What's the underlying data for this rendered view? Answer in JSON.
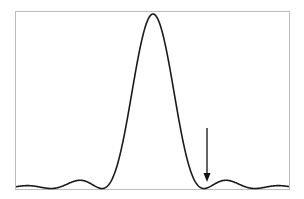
{
  "chart_data": {
    "type": "line",
    "title": "",
    "xlabel": "",
    "ylabel": "",
    "function": "I(x) = (sin(pi x)/(pi x))^2",
    "xlim": [
      -2.7,
      2.65
    ],
    "ylim": [
      0,
      1.0
    ],
    "grid": false,
    "legend": null,
    "series": [
      {
        "name": "intensity",
        "x": [
          -2.5,
          -2.0,
          -1.5,
          -1.0,
          -0.5,
          0.0,
          0.5,
          1.0,
          1.5,
          2.0,
          2.5
        ],
        "values": [
          0.016,
          0.0,
          0.045,
          0.0,
          0.405,
          1.0,
          0.405,
          0.0,
          0.045,
          0.0,
          0.016
        ]
      }
    ],
    "annotations": [
      {
        "type": "arrow",
        "target_x": 1.0,
        "label": "",
        "meaning": "first minimum"
      }
    ]
  },
  "colors": {
    "frame": "#bdbdbd",
    "curve": "#1a1a1a",
    "arrow": "#111111",
    "background": "#ffffff"
  },
  "layout": {
    "frame": {
      "left": 15,
      "top": 11,
      "right": 289,
      "bottom": 189
    },
    "center_px": 153,
    "px_per_unit": 51,
    "peak_px_y": 14,
    "arrow": {
      "x": 207,
      "y_top": 128,
      "y_tip": 182
    }
  }
}
